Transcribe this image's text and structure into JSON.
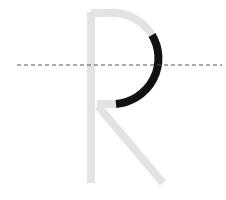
{
  "diagram": {
    "letter": "R",
    "colors": {
      "background": "#ffffff",
      "inactive_stroke": "#e3e3e3",
      "active_stroke": "#111111",
      "guide_line": "#555555"
    },
    "guide_line": {
      "style": "dashed",
      "x1": 17,
      "x2": 222,
      "y": 65
    },
    "strokes": [
      {
        "name": "stem",
        "state": "inactive",
        "path": "M 91 12 L 91 183"
      },
      {
        "name": "bowl-top",
        "state": "inactive",
        "path": "M 91 13 L 108 13 A 47 46 0 0 1 152 35"
      },
      {
        "name": "bowl-right",
        "state": "active",
        "path": "M 152 35 A 47 46 0 0 1 116 104"
      },
      {
        "name": "bowl-join",
        "state": "inactive",
        "path": "M 116 104 L 97 104"
      },
      {
        "name": "leg",
        "state": "inactive",
        "path": "M 98 106 L 163 183"
      }
    ],
    "stroke_width": 8
  }
}
